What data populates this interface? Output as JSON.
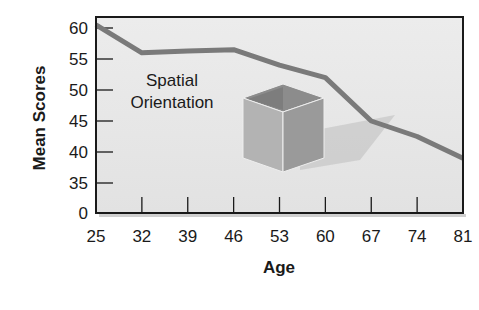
{
  "chart_data": {
    "type": "line",
    "title": "",
    "xlabel": "Age",
    "ylabel": "Mean Scores",
    "x": [
      25,
      32,
      39,
      46,
      53,
      60,
      67,
      74,
      81
    ],
    "series": [
      {
        "name": "Spatial Orientation",
        "values": [
          60.5,
          56,
          56.3,
          56.5,
          54,
          52,
          45,
          42.5,
          39
        ]
      }
    ],
    "x_tick_labels": [
      "25",
      "32",
      "39",
      "46",
      "53",
      "60",
      "67",
      "74",
      "81"
    ],
    "y_tick_labels": [
      "0",
      "35",
      "40",
      "45",
      "50",
      "55",
      "60"
    ],
    "ylim": [
      35,
      62
    ],
    "y_axis_break": "0 shown at baseline with axis break below 35",
    "annotation": "Spatial Orientation",
    "grid": false,
    "legend": "none",
    "colors": {
      "line": "#7a7a7a",
      "plot_bg": "#e6e6e6",
      "frame": "#1a1a1a"
    }
  },
  "labels": {
    "ylabel": "Mean Scores",
    "xlabel": "Age",
    "annot_line1": "Spatial",
    "annot_line2": "Orientation"
  }
}
